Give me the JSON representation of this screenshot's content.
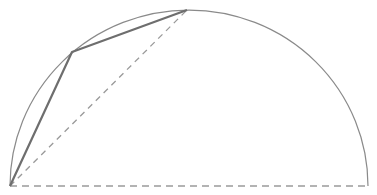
{
  "diagram": {
    "width": 377,
    "height": 195,
    "colors": {
      "background": "#ffffff",
      "arc": "#8a8a8a",
      "polyline": "#6e6e6e",
      "dashed": "#9a9a9a"
    },
    "arc": {
      "cx": 189,
      "cy": 186,
      "rx": 179,
      "ry": 176
    },
    "baseline": {
      "x1": 10,
      "y1": 186,
      "x2": 368,
      "y2": 186
    },
    "points": {
      "A": [
        10,
        186
      ],
      "B": [
        72,
        52
      ],
      "C": [
        187,
        10
      ]
    },
    "chord_dashed": {
      "from": "A",
      "to": "C"
    }
  }
}
